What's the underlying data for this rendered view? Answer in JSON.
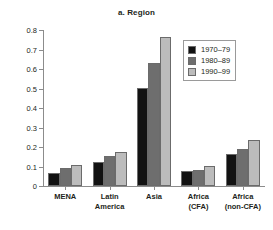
{
  "chart_data": {
    "type": "bar",
    "title": "a. Region",
    "xlabel": "",
    "ylabel": "",
    "ylim": [
      0,
      0.8
    ],
    "yticks": [
      "0",
      "0.1",
      "0.2",
      "0.3",
      "0.4",
      "0.5",
      "0.6",
      "0.7",
      "0.8"
    ],
    "grid": false,
    "legend_position": "top-right",
    "categories": [
      "MENA",
      "Latin America",
      "Asia",
      "Africa (CFA)",
      "Africa (non-CFA)"
    ],
    "category_lines": [
      [
        "MENA"
      ],
      [
        "Latin",
        "America"
      ],
      [
        "Asia"
      ],
      [
        "Africa",
        "(CFA)"
      ],
      [
        "Africa",
        "(non-CFA)"
      ]
    ],
    "series": [
      {
        "name": "1970–79",
        "color": "#121212",
        "values": [
          0.065,
          0.123,
          0.501,
          0.077,
          0.163
        ]
      },
      {
        "name": "1980–89",
        "color": "#6e6e6e",
        "values": [
          0.09,
          0.155,
          0.63,
          0.083,
          0.192
        ]
      },
      {
        "name": "1990–99",
        "color": "#bcbcbc",
        "values": [
          0.108,
          0.172,
          0.765,
          0.105,
          0.238
        ]
      }
    ]
  }
}
